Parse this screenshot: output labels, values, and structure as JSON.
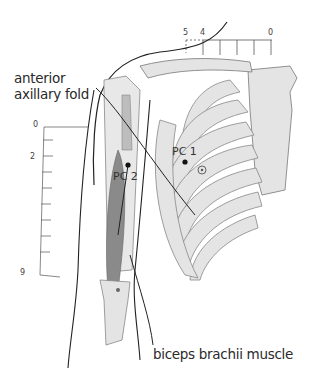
{
  "labels": {
    "anterior_axillary_fold_line1": "anterior",
    "anterior_axillary_fold_line2": "axillary fold",
    "biceps": "biceps brachii muscle"
  },
  "points": {
    "pc1": "PC 1",
    "pc2": "PC 2"
  },
  "top_scale": {
    "left_a": "5",
    "left_b": "4",
    "right": "0"
  },
  "arm_scale": {
    "top": "0",
    "mid": "2",
    "bottom": "9"
  },
  "colors": {
    "bone": "#e4e4e4",
    "outline": "#222222",
    "muscle_dark": "#8a8a8a",
    "muscle_light": "#bdbdbd"
  }
}
